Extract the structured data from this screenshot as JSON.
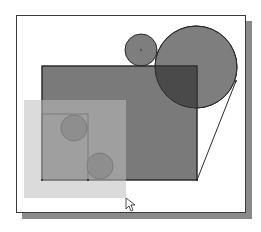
{
  "diagram": {
    "type": "cad-sketch-selection",
    "colors": {
      "background": "#ffffff",
      "frame_border": "#3a3a3a",
      "shadow": "#8a8a8a",
      "shape_fill": "#7e7e7e",
      "overlap_fill": "#4a4a4a",
      "small_circle_fill": "#5a5a5a",
      "selection_fill": "#b4b4b4",
      "stroke": "#2a2a2a"
    },
    "shapes": {
      "big_rect": {
        "x": 42,
        "y": 66,
        "w": 155,
        "h": 114
      },
      "inner_rect": {
        "x": 42,
        "y": 114,
        "w": 46,
        "h": 66
      },
      "top_small_circle": {
        "cx": 141,
        "cy": 50,
        "r": 16
      },
      "top_big_circle": {
        "cx": 196,
        "cy": 67,
        "r": 41
      },
      "inner_circle_1": {
        "cx": 74,
        "cy": 128,
        "r": 13
      },
      "inner_circle_2": {
        "cx": 100,
        "cy": 166,
        "r": 13
      },
      "tangent_line": {
        "x1": 197,
        "y1": 180,
        "x2": 236,
        "y2": 81
      },
      "selection_window": {
        "x": 24,
        "y": 100,
        "w": 102,
        "h": 98
      }
    },
    "cursor": {
      "x": 126,
      "y": 198,
      "icon": "arrow-pointer-icon"
    }
  }
}
